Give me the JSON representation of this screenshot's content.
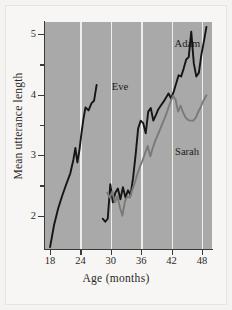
{
  "chart_data": {
    "type": "line",
    "title": "",
    "xlabel": "Age (months)",
    "ylabel": "Mean utterance length",
    "xlim": [
      17,
      50
    ],
    "ylim": [
      1.45,
      5.2
    ],
    "xticks": [
      18,
      24,
      30,
      36,
      42,
      48
    ],
    "yticks": [
      2,
      3,
      4,
      5
    ],
    "yticks_minor": [
      2.5,
      3.5,
      4.5
    ],
    "grid": "vertical-white-at-xticks",
    "legend": "inline-labels",
    "plot_background": "#a9a9a9",
    "gridline_color": "#efeeec",
    "series": [
      {
        "name": "Eve",
        "color": "#151514",
        "label_x": 30.2,
        "label_y": 4.12,
        "x": [
          18.0,
          18.8,
          19.6,
          20.4,
          21.2,
          22.0,
          22.6,
          23.0,
          23.4,
          23.8,
          24.2,
          24.6,
          25.0,
          25.6,
          26.2,
          26.7,
          27.2
        ],
        "y": [
          1.48,
          1.85,
          2.12,
          2.33,
          2.52,
          2.7,
          2.92,
          3.12,
          2.88,
          3.08,
          3.36,
          3.6,
          3.79,
          3.74,
          3.86,
          3.9,
          4.16
        ]
      },
      {
        "name": "Adam",
        "color": "#151514",
        "label_x": 42.6,
        "label_y": 4.83,
        "x": [
          28.4,
          28.9,
          29.4,
          29.9,
          30.4,
          30.9,
          31.4,
          31.9,
          32.4,
          32.9,
          33.4,
          33.9,
          34.4,
          34.9,
          35.4,
          35.9,
          36.4,
          36.9,
          37.4,
          37.9,
          38.4,
          38.9,
          39.4,
          39.9,
          40.4,
          40.9,
          41.4,
          41.9,
          42.4,
          42.9,
          43.4,
          43.9,
          44.4,
          44.9,
          45.4,
          45.9,
          46.4,
          46.9,
          47.4,
          47.9,
          48.4,
          48.9
        ],
        "y": [
          1.95,
          1.9,
          1.95,
          2.52,
          2.22,
          2.38,
          2.45,
          2.27,
          2.47,
          2.3,
          2.42,
          2.34,
          2.62,
          3.0,
          3.44,
          3.57,
          3.53,
          3.36,
          3.72,
          3.78,
          3.57,
          3.66,
          3.76,
          3.82,
          3.88,
          3.95,
          4.02,
          3.94,
          4.04,
          4.18,
          4.32,
          4.3,
          4.43,
          4.58,
          4.62,
          5.04,
          4.52,
          4.3,
          4.36,
          4.66,
          4.88,
          5.12
        ]
      },
      {
        "name": "Sarah",
        "color": "#7a7a78",
        "label_x": 42.7,
        "label_y": 3.06,
        "x": [
          29.3,
          29.8,
          30.3,
          30.8,
          31.3,
          31.8,
          32.3,
          32.8,
          33.3,
          33.8,
          34.3,
          34.8,
          35.3,
          35.8,
          36.3,
          36.8,
          37.3,
          37.8,
          38.3,
          38.8,
          39.3,
          39.8,
          40.3,
          40.8,
          41.3,
          41.8,
          42.3,
          42.8,
          43.3,
          43.8,
          44.3,
          44.8,
          45.3,
          45.8,
          46.3,
          46.8,
          47.3,
          47.8,
          48.3,
          48.9
        ],
        "y": [
          2.38,
          2.3,
          2.4,
          2.22,
          2.32,
          2.14,
          2.0,
          2.24,
          2.32,
          2.3,
          2.44,
          2.56,
          2.7,
          2.82,
          2.92,
          3.04,
          3.15,
          2.98,
          3.12,
          3.24,
          3.34,
          3.44,
          3.54,
          3.64,
          3.76,
          3.88,
          3.98,
          3.92,
          3.72,
          3.82,
          3.7,
          3.62,
          3.58,
          3.57,
          3.57,
          3.62,
          3.72,
          3.8,
          3.9,
          3.99
        ]
      }
    ]
  }
}
